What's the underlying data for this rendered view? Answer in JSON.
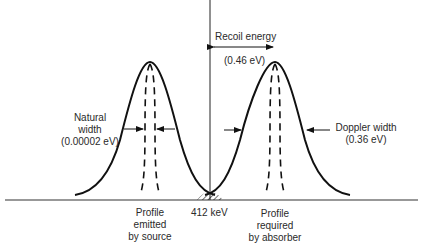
{
  "diagram": {
    "recoil_energy": {
      "label": "Recoil energy",
      "value": "(0.46 eV)"
    },
    "natural_width": {
      "line1": "Natural",
      "line2": "width",
      "line3": "(0.00002 eV)"
    },
    "doppler_width": {
      "line1": "Doppler width",
      "line2": "(0.36 eV)"
    },
    "center_energy": "412 keV",
    "source_profile": {
      "line1": "Profile",
      "line2": "emitted",
      "line3": "by source"
    },
    "absorber_profile": {
      "line1": "Profile",
      "line2": "required",
      "line3": "by absorber"
    },
    "colors": {
      "line": "#111111",
      "text": "#2a2a2a",
      "background": "#ffffff"
    }
  }
}
